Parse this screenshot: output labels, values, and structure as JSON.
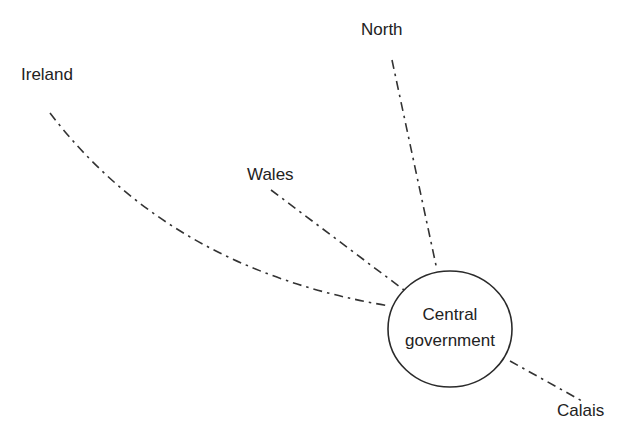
{
  "diagram": {
    "type": "hub-and-spoke",
    "line_style": "dash-dot",
    "center_node": {
      "line1": "Central",
      "line2": "government"
    },
    "peripheral_nodes": [
      {
        "id": "north",
        "label": "North"
      },
      {
        "id": "ireland",
        "label": "Ireland"
      },
      {
        "id": "wales",
        "label": "Wales"
      },
      {
        "id": "calais",
        "label": "Calais"
      }
    ],
    "colors": {
      "background": "#ffffff",
      "stroke": "#333333",
      "text": "#222222"
    }
  }
}
